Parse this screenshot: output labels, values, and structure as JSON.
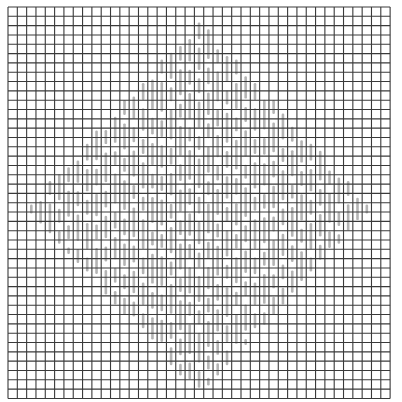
{
  "figure": {
    "title": "",
    "description": "Square grid with diamond-shaped field of vertical gray bars",
    "background": "#ffffff"
  },
  "grid": {
    "origin_x": 8,
    "origin_y": 7,
    "cell": 9.32,
    "cols": 41,
    "rows": 42,
    "line_color": "#3a3a3a",
    "line_width": 1.1
  },
  "diamond": {
    "center_col": 20,
    "center_row": 21,
    "half_width_cols": 18.6,
    "half_height_rows": 20.2,
    "bar_color": "#b4b4b4",
    "bar_width": 2.6
  },
  "bars_pattern": {
    "phase_a": [
      0,
      2,
      1,
      3,
      0,
      1,
      2,
      3,
      1,
      0,
      3,
      2
    ],
    "lengths": [
      1.6,
      2.4,
      1.8,
      3.2,
      1.5,
      2.8
    ],
    "gap": 0.9
  }
}
